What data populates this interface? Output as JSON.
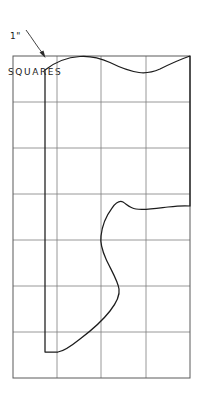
{
  "figure": {
    "title_annotation": {
      "line1": "1\"",
      "line2": "SQUARES",
      "icon": "leader-arrow-icon"
    },
    "colors": {
      "background": "#ffffff",
      "grid": "#7d7d7d",
      "grid_border": "#5a5a5a",
      "outline": "#1c1c1c",
      "leader": "#2a2a2a"
    },
    "grid": {
      "description": "1 inch square grid",
      "columns": 4,
      "rows": 7,
      "x_lines": [
        13,
        57,
        101,
        146,
        190
      ],
      "y_lines": [
        56,
        102,
        148,
        194,
        240,
        286,
        332,
        378
      ],
      "cell_size_label": "1\"",
      "left": 13,
      "top": 56,
      "right": 190,
      "bottom": 378
    },
    "leader": {
      "start_x": 26,
      "start_y": 30,
      "end_x": 44,
      "end_y": 56,
      "arrow_tip_x": 45,
      "arrow_tip_y": 58
    },
    "outline": {
      "description": "pattern piece outline drawn over the 1 inch square grid",
      "left_edge_x": 45,
      "left_edge_top_y": 70,
      "left_edge_bottom_y": 352,
      "bottom_stub_end_x": 58,
      "top_curve": [
        [
          45,
          70
        ],
        [
          62,
          60
        ],
        [
          82,
          57
        ],
        [
          100,
          59
        ],
        [
          118,
          66
        ],
        [
          136,
          72
        ],
        [
          150,
          72
        ],
        [
          168,
          64
        ],
        [
          190,
          56
        ]
      ],
      "right_edge": [
        [
          190,
          56
        ],
        [
          190,
          206
        ]
      ],
      "inner_curve": [
        [
          190,
          206
        ],
        [
          168,
          207
        ],
        [
          148,
          210
        ],
        [
          132,
          209
        ],
        [
          122,
          202
        ],
        [
          116,
          203
        ],
        [
          108,
          213
        ],
        [
          102,
          227
        ],
        [
          101,
          240
        ],
        [
          104,
          254
        ],
        [
          113,
          272
        ],
        [
          120,
          288
        ],
        [
          119,
          298
        ],
        [
          113,
          307
        ],
        [
          101,
          320
        ],
        [
          88,
          333
        ],
        [
          74,
          344
        ],
        [
          62,
          351
        ],
        [
          58,
          352
        ]
      ]
    }
  }
}
